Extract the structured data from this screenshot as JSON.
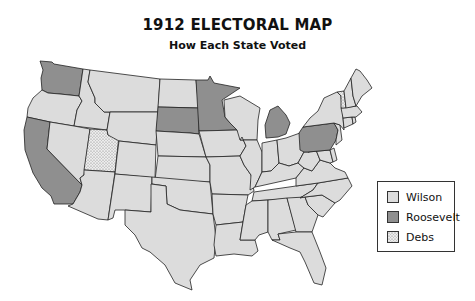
{
  "title": "1912 ELECTORAL MAP",
  "subtitle": "How Each State Voted",
  "colors": {
    "Wilson": "#dcdcdc",
    "Roosevelt": "#8f8f8f",
    "Debs": "#e8e8e8",
    "stipple": "#777777",
    "outline": "#222222"
  },
  "legend": [
    {
      "label": "Wilson",
      "party": "Wilson"
    },
    {
      "label": "Roosevelt",
      "party": "Roosevelt"
    },
    {
      "label": "Debs",
      "party": "Debs"
    }
  ],
  "states": [
    {
      "name": "Washington",
      "vote": "Roosevelt"
    },
    {
      "name": "Oregon",
      "vote": "Wilson"
    },
    {
      "name": "California",
      "vote": "Roosevelt"
    },
    {
      "name": "Idaho",
      "vote": "Wilson"
    },
    {
      "name": "Nevada",
      "vote": "Wilson"
    },
    {
      "name": "Utah",
      "vote": "Debs"
    },
    {
      "name": "Arizona",
      "vote": "Wilson"
    },
    {
      "name": "Montana",
      "vote": "Wilson"
    },
    {
      "name": "Wyoming",
      "vote": "Wilson"
    },
    {
      "name": "Colorado",
      "vote": "Wilson"
    },
    {
      "name": "New Mexico",
      "vote": "Wilson"
    },
    {
      "name": "North Dakota",
      "vote": "Wilson"
    },
    {
      "name": "South Dakota",
      "vote": "Roosevelt"
    },
    {
      "name": "Nebraska",
      "vote": "Wilson"
    },
    {
      "name": "Kansas",
      "vote": "Wilson"
    },
    {
      "name": "Oklahoma",
      "vote": "Wilson"
    },
    {
      "name": "Texas",
      "vote": "Wilson"
    },
    {
      "name": "Minnesota",
      "vote": "Roosevelt"
    },
    {
      "name": "Iowa",
      "vote": "Wilson"
    },
    {
      "name": "Missouri",
      "vote": "Wilson"
    },
    {
      "name": "Arkansas",
      "vote": "Wilson"
    },
    {
      "name": "Louisiana",
      "vote": "Wilson"
    },
    {
      "name": "Wisconsin",
      "vote": "Wilson"
    },
    {
      "name": "Illinois",
      "vote": "Wilson"
    },
    {
      "name": "Michigan",
      "vote": "Roosevelt"
    },
    {
      "name": "Indiana",
      "vote": "Wilson"
    },
    {
      "name": "Ohio",
      "vote": "Wilson"
    },
    {
      "name": "Kentucky",
      "vote": "Wilson"
    },
    {
      "name": "Tennessee",
      "vote": "Wilson"
    },
    {
      "name": "Mississippi",
      "vote": "Wilson"
    },
    {
      "name": "Alabama",
      "vote": "Wilson"
    },
    {
      "name": "Georgia",
      "vote": "Wilson"
    },
    {
      "name": "Florida",
      "vote": "Wilson"
    },
    {
      "name": "South Carolina",
      "vote": "Wilson"
    },
    {
      "name": "North Carolina",
      "vote": "Wilson"
    },
    {
      "name": "Virginia",
      "vote": "Wilson"
    },
    {
      "name": "West Virginia",
      "vote": "Wilson"
    },
    {
      "name": "Maryland",
      "vote": "Wilson"
    },
    {
      "name": "Delaware",
      "vote": "Wilson"
    },
    {
      "name": "Pennsylvania",
      "vote": "Roosevelt"
    },
    {
      "name": "New Jersey",
      "vote": "Wilson"
    },
    {
      "name": "New York",
      "vote": "Wilson"
    },
    {
      "name": "Connecticut",
      "vote": "Wilson"
    },
    {
      "name": "Rhode Island",
      "vote": "Wilson"
    },
    {
      "name": "Massachusetts",
      "vote": "Wilson"
    },
    {
      "name": "Vermont",
      "vote": "Debs"
    },
    {
      "name": "New Hampshire",
      "vote": "Wilson"
    },
    {
      "name": "Maine",
      "vote": "Wilson"
    }
  ]
}
